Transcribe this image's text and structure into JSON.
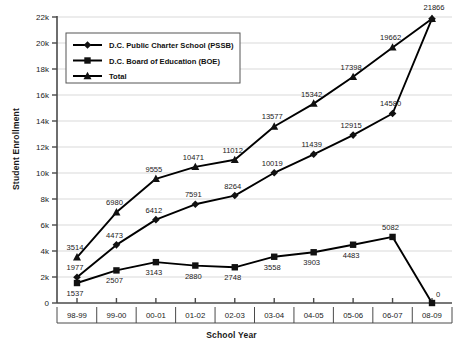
{
  "chart_data": {
    "type": "line",
    "title": "",
    "xlabel": "School Year",
    "ylabel": "Student Enrollment",
    "categories": [
      "98-99",
      "99-00",
      "00-01",
      "01-02",
      "02-03",
      "03-04",
      "04-05",
      "05-06",
      "06-07",
      "08-09"
    ],
    "ylim": [
      0,
      22000
    ],
    "ytick_labels": [
      "0",
      "2k",
      "4k",
      "6k",
      "8k",
      "10k",
      "12k",
      "14k",
      "16k",
      "18k",
      "20k",
      "22k"
    ],
    "ytick_values": [
      0,
      2000,
      4000,
      6000,
      8000,
      10000,
      12000,
      14000,
      16000,
      18000,
      20000,
      22000
    ],
    "grid": "horizontal",
    "legend_position": "top-left-inside",
    "series": [
      {
        "name": "D.C. Public Charter School (PSSB)",
        "marker": "diamond",
        "color": "#000000",
        "values": [
          1977,
          4473,
          6412,
          7591,
          8264,
          10019,
          11439,
          12915,
          14580,
          21866
        ],
        "labels": [
          "1977",
          "4473",
          "6412",
          "7591",
          "8264",
          "10019",
          "11439",
          "12915",
          "14580",
          "21866"
        ]
      },
      {
        "name": "D.C. Board of Education (BOE)",
        "marker": "square",
        "color": "#000000",
        "values": [
          1537,
          2507,
          3143,
          2880,
          2748,
          3558,
          3903,
          4483,
          5082,
          0
        ],
        "labels": [
          "1537",
          "2507",
          "3143",
          "2880",
          "2748",
          "3558",
          "3903",
          "4483",
          "5082",
          "0"
        ]
      },
      {
        "name": "Total",
        "marker": "triangle",
        "color": "#000000",
        "values": [
          3514,
          6980,
          9555,
          10471,
          11012,
          13577,
          15342,
          17398,
          19662,
          21866
        ],
        "labels": [
          "3514",
          "6980",
          "9555",
          "10471",
          "11012",
          "13577",
          "15342",
          "17398",
          "19662",
          "21866"
        ]
      }
    ]
  },
  "axis": {
    "x_title": "School Year",
    "y_title": "Student Enrollment"
  },
  "legend": {
    "items": [
      {
        "label": "D.C. Public Charter School (PSSB)",
        "marker": "diamond"
      },
      {
        "label": "D.C. Board of Education (BOE)",
        "marker": "square"
      },
      {
        "label": "Total",
        "marker": "triangle"
      }
    ]
  },
  "colors": {
    "ink": "#111111",
    "grid": "#d5d5d5",
    "axis": "#4a4a4a",
    "background": "#ffffff"
  }
}
